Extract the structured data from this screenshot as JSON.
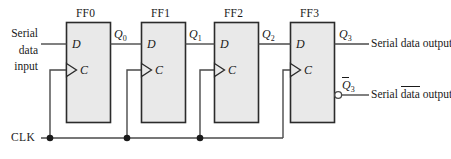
{
  "diagram": {
    "colors": {
      "wire": "#4a4a4a",
      "box_border": "#2b2b2b",
      "box_fill": "#e9e9e9",
      "text": "#1a1a1a",
      "background": "#ffffff"
    },
    "flipflops": [
      {
        "name": "FF0",
        "d_pin": "D",
        "c_pin": "C"
      },
      {
        "name": "FF1",
        "d_pin": "D",
        "c_pin": "C"
      },
      {
        "name": "FF2",
        "d_pin": "D",
        "c_pin": "C"
      },
      {
        "name": "FF3",
        "d_pin": "D",
        "c_pin": "C"
      }
    ],
    "input_label": {
      "line1": "Serial",
      "line2": "data",
      "line3": "input"
    },
    "node_labels": [
      {
        "base": "Q",
        "sub": "0"
      },
      {
        "base": "Q",
        "sub": "1"
      },
      {
        "base": "Q",
        "sub": "2"
      },
      {
        "base": "Q",
        "sub": "3"
      },
      {
        "base": "Q",
        "sub": "3",
        "inverted": true
      }
    ],
    "outputs": [
      {
        "text_pre": "Serial ",
        "text_bar": "",
        "text_post": "data output",
        "inverted": false
      },
      {
        "text_pre": "Serial ",
        "text_bar": "data",
        "text_post": " output",
        "inverted": true
      }
    ],
    "clock": {
      "label": "CLK"
    }
  }
}
